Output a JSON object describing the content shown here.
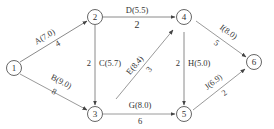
{
  "diagram": {
    "type": "activity-on-arrow network",
    "colors": {
      "edge_normal": "#8a8a8a",
      "edge_critical": "#9a9a9a",
      "node_stroke": "#555555",
      "text": "#333333"
    },
    "nodes": [
      {
        "id": "1",
        "label": "1",
        "x": 14,
        "y": 68
      },
      {
        "id": "2",
        "label": "2",
        "x": 95,
        "y": 17
      },
      {
        "id": "3",
        "label": "3",
        "x": 95,
        "y": 114
      },
      {
        "id": "4",
        "label": "4",
        "x": 184,
        "y": 17
      },
      {
        "id": "5",
        "label": "5",
        "x": 184,
        "y": 114
      },
      {
        "id": "6",
        "label": "6",
        "x": 254,
        "y": 62
      }
    ],
    "edges": [
      {
        "id": "A",
        "from": "1",
        "to": "2",
        "activity": "A(7.0)",
        "duration": "4",
        "thick": false
      },
      {
        "id": "B",
        "from": "1",
        "to": "3",
        "activity": "B(9.0)",
        "duration": "8",
        "thick": true
      },
      {
        "id": "C",
        "from": "2",
        "to": "3",
        "activity": "C(5.7)",
        "duration": "2",
        "thick": false
      },
      {
        "id": "D",
        "from": "2",
        "to": "4",
        "activity": "D(5.5)",
        "duration": "2",
        "thick": false
      },
      {
        "id": "E",
        "from": "3",
        "to": "4",
        "activity": "E(8.4)",
        "duration": "3",
        "thick": true
      },
      {
        "id": "G",
        "from": "3",
        "to": "5",
        "activity": "G(8.0)",
        "duration": "6",
        "thick": true
      },
      {
        "id": "H",
        "from": "4",
        "to": "5",
        "activity": "H(5.0)",
        "duration": "2",
        "thick": false
      },
      {
        "id": "I",
        "from": "4",
        "to": "6",
        "activity": "I(8.0)",
        "duration": "5",
        "thick": true
      },
      {
        "id": "J",
        "from": "5",
        "to": "6",
        "activity": "J(6.9)",
        "duration": "2",
        "thick": true
      }
    ]
  }
}
